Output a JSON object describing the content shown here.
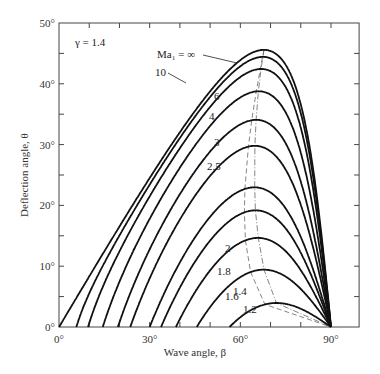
{
  "chart_data": {
    "type": "line",
    "title": "",
    "annotation": "γ = 1.4",
    "gamma": 1.4,
    "xlabel": "Wave angle, β",
    "ylabel": "Deflection angle, θ",
    "xlim": [
      0,
      100
    ],
    "ylim": [
      0,
      50
    ],
    "x_tick_labels": [
      "0°",
      "30°",
      "60°",
      "90°"
    ],
    "x_tick_values": [
      0,
      30,
      60,
      90
    ],
    "x_minor_ticks": [
      10,
      20,
      40,
      50,
      70,
      80
    ],
    "y_tick_labels": [
      "0°",
      "10°",
      "20°",
      "30°",
      "40°",
      "50°"
    ],
    "y_tick_values": [
      0,
      10,
      20,
      30,
      40,
      50
    ],
    "y_minor_ticks": [
      5,
      15,
      25,
      35,
      45
    ],
    "grid": false,
    "legend": "inline curve labels",
    "series": [
      {
        "name": "Ma1 = ∞",
        "mach": 1000,
        "label": "Ma₁ = ∞",
        "theta_max_deg": 45.6,
        "beta_at_max_deg": 67.8
      },
      {
        "name": "10",
        "mach": 10,
        "label": "10",
        "theta_max_deg": 42.4,
        "beta_at_max_deg": 65.8
      },
      {
        "name": "6",
        "mach": 6,
        "label": "6",
        "theta_max_deg": 41.0,
        "beta_at_max_deg": 65.8
      },
      {
        "name": "4",
        "mach": 4,
        "label": "4",
        "theta_max_deg": 38.8,
        "beta_at_max_deg": 65.2
      },
      {
        "name": "3",
        "mach": 3,
        "label": "3",
        "theta_max_deg": 34.1,
        "beta_at_max_deg": 65.2
      },
      {
        "name": "2.5",
        "mach": 2.5,
        "label": "2.5",
        "theta_max_deg": 29.8,
        "beta_at_max_deg": 64.8
      },
      {
        "name": "2",
        "mach": 2,
        "label": "2",
        "theta_max_deg": 23.0,
        "beta_at_max_deg": 64.7
      },
      {
        "name": "1.8",
        "mach": 1.8,
        "label": "1.8",
        "theta_max_deg": 19.2,
        "beta_at_max_deg": 64.9
      },
      {
        "name": "1.6",
        "mach": 1.6,
        "label": "1.6",
        "theta_max_deg": 14.7,
        "beta_at_max_deg": 65.6
      },
      {
        "name": "1.4",
        "mach": 1.4,
        "label": "1.4",
        "theta_max_deg": 9.4,
        "beta_at_max_deg": 67.7
      },
      {
        "name": "1.2",
        "mach": 1.2,
        "label": "1.2",
        "theta_max_deg": 3.9,
        "beta_at_max_deg": 72.1
      }
    ],
    "reference_lines": [
      {
        "name": "theta_max locus",
        "style": "dash-dot"
      },
      {
        "name": "Ma2 = 1 (sonic) locus",
        "style": "dashed"
      }
    ]
  },
  "style": {
    "curve_color": "#111111",
    "axis_color": "#444444",
    "locus_color": "#666666"
  }
}
